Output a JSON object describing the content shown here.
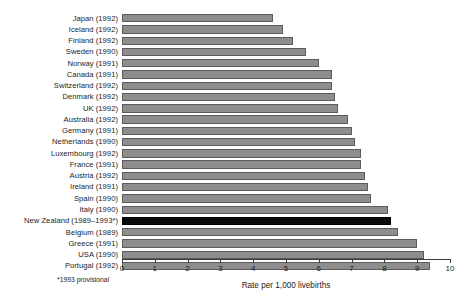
{
  "chart_data": {
    "type": "bar",
    "orientation": "horizontal",
    "title": "",
    "xlabel": "Rate per 1,000 livebirths",
    "ylabel": "",
    "xlim": [
      0,
      10
    ],
    "xticks": [
      "0",
      "1",
      "2",
      "3",
      "4",
      "5",
      "6",
      "7",
      "8",
      "9",
      "10"
    ],
    "grid": false,
    "legend": null,
    "footnote": "*1993 provisional",
    "highlight_category": "New Zealand (1989–1993*)",
    "colors": {
      "bar": "#8d8d8d",
      "bar_border": "#5c5c5c",
      "highlight": "#0a0a0a",
      "background": "#ffffff"
    },
    "categories": [
      "Japan (1992)",
      "Iceland (1992)",
      "Finland (1992)",
      "Sweden (1990)",
      "Norway (1991)",
      "Canada (1991)",
      "Switzerland (1992)",
      "Denmark (1992)",
      "UK (1992)",
      "Australia (1992)",
      "Germany (1991)",
      "Netherlands (1990)",
      "Luxembourg (1992)",
      "France (1991)",
      "Austria (1992)",
      "Ireland (1991)",
      "Spain (1990)",
      "Italy (1990)",
      "New Zealand (1989–1993*)",
      "Belgium (1989)",
      "Greece (1991)",
      "USA (1990)",
      "Portugal (1992)"
    ],
    "values": [
      4.6,
      4.9,
      5.2,
      5.6,
      6.0,
      6.4,
      6.4,
      6.5,
      6.6,
      6.9,
      7.0,
      7.1,
      7.3,
      7.3,
      7.4,
      7.5,
      7.6,
      8.1,
      8.2,
      8.4,
      9.0,
      9.2,
      9.4
    ]
  }
}
